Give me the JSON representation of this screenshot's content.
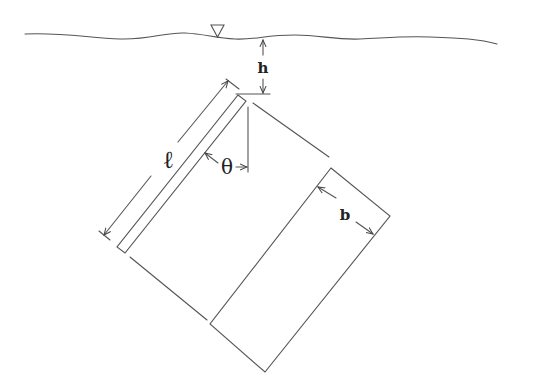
{
  "diagram": {
    "labels": {
      "depth": "h",
      "length": "ℓ",
      "angle": "θ",
      "width": "b"
    },
    "symbols": {
      "free_surface_marker": "▽"
    },
    "colors": {
      "line": "#555555",
      "text": "#222222",
      "background": "#ffffff"
    }
  }
}
